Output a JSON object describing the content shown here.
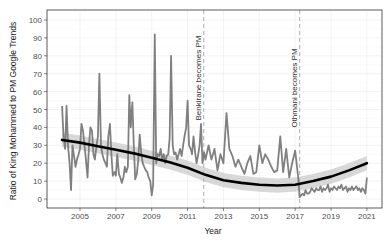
{
  "chart_data": {
    "type": "line",
    "title": "",
    "xlabel": "Year",
    "ylabel": "Ratio of King Mohammed to PM Google Trends",
    "xlim": [
      2003.2,
      2021.8
    ],
    "ylim": [
      -5,
      105
    ],
    "x_ticks": [
      2005,
      2007,
      2009,
      2011,
      2013,
      2015,
      2017,
      2019,
      2021
    ],
    "y_ticks": [
      0,
      10,
      20,
      30,
      40,
      50,
      60,
      70,
      80,
      90,
      100
    ],
    "grid": true,
    "legend": null,
    "colors": {
      "series": "#808080",
      "trend": "#000000",
      "ribbon": "#c8c8c8",
      "vline": "#bbbbbb",
      "panel_border": "#333333",
      "grid": "#ebebeb"
    },
    "annotations": [
      {
        "x": 2011.9,
        "label": "Benkirane becomes PM",
        "style": "dashed vertical line"
      },
      {
        "x": 2017.25,
        "label": "Othmani becomes PM",
        "style": "dashed vertical line"
      }
    ],
    "series": [
      {
        "name": "Monthly ratio",
        "style": "line",
        "x": [
          2004.0,
          2004.08,
          2004.17,
          2004.25,
          2004.33,
          2004.42,
          2004.5,
          2004.58,
          2004.67,
          2004.75,
          2004.83,
          2004.92,
          2005.0,
          2005.08,
          2005.17,
          2005.25,
          2005.33,
          2005.42,
          2005.5,
          2005.58,
          2005.67,
          2005.75,
          2005.83,
          2005.92,
          2006.0,
          2006.08,
          2006.17,
          2006.25,
          2006.33,
          2006.42,
          2006.5,
          2006.58,
          2006.67,
          2006.75,
          2006.83,
          2006.92,
          2007.0,
          2007.08,
          2007.17,
          2007.25,
          2007.33,
          2007.42,
          2007.5,
          2007.58,
          2007.67,
          2007.75,
          2007.83,
          2007.92,
          2008.0,
          2008.08,
          2008.17,
          2008.25,
          2008.33,
          2008.42,
          2008.5,
          2008.58,
          2008.67,
          2008.75,
          2008.83,
          2008.92,
          2009.0,
          2009.08,
          2009.17,
          2009.25,
          2009.33,
          2009.42,
          2009.5,
          2009.58,
          2009.67,
          2009.75,
          2009.83,
          2009.92,
          2010.0,
          2010.08,
          2010.17,
          2010.25,
          2010.33,
          2010.42,
          2010.5,
          2010.58,
          2010.67,
          2010.75,
          2010.83,
          2010.92,
          2011.0,
          2011.08,
          2011.17,
          2011.25,
          2011.33,
          2011.42,
          2011.5,
          2011.58,
          2011.67,
          2011.75,
          2011.83,
          2011.92,
          2012.0,
          2012.17,
          2012.33,
          2012.5,
          2012.67,
          2012.83,
          2013.0,
          2013.17,
          2013.33,
          2013.5,
          2013.67,
          2013.83,
          2014.0,
          2014.17,
          2014.33,
          2014.5,
          2014.67,
          2014.83,
          2015.0,
          2015.17,
          2015.33,
          2015.5,
          2015.67,
          2015.83,
          2016.0,
          2016.17,
          2016.33,
          2016.5,
          2016.67,
          2016.83,
          2017.0,
          2017.17,
          2017.25,
          2017.33,
          2017.42,
          2017.5,
          2017.58,
          2017.67,
          2017.75,
          2017.83,
          2017.92,
          2018.0,
          2018.08,
          2018.17,
          2018.25,
          2018.33,
          2018.42,
          2018.5,
          2018.58,
          2018.67,
          2018.75,
          2018.83,
          2018.92,
          2019.0,
          2019.08,
          2019.17,
          2019.25,
          2019.33,
          2019.42,
          2019.5,
          2019.58,
          2019.67,
          2019.75,
          2019.83,
          2019.92,
          2020.0,
          2020.08,
          2020.17,
          2020.25,
          2020.33,
          2020.42,
          2020.5,
          2020.58,
          2020.67,
          2020.75,
          2020.83,
          2020.92,
          2021.0
        ],
        "y": [
          52,
          35,
          28,
          52,
          30,
          20,
          5,
          30,
          24,
          18,
          22,
          25,
          28,
          42,
          38,
          30,
          22,
          12,
          30,
          40,
          38,
          25,
          22,
          30,
          35,
          70,
          30,
          25,
          22,
          20,
          18,
          35,
          42,
          25,
          13,
          15,
          13,
          25,
          14,
          12,
          9,
          12,
          18,
          15,
          18,
          58,
          40,
          54,
          30,
          11,
          14,
          22,
          36,
          25,
          20,
          18,
          16,
          15,
          12,
          10,
          2,
          8,
          92,
          20,
          25,
          24,
          28,
          22,
          25,
          20,
          24,
          25,
          34,
          80,
          30,
          25,
          26,
          22,
          25,
          28,
          24,
          30,
          35,
          40,
          55,
          30,
          28,
          25,
          35,
          26,
          20,
          24,
          30,
          42,
          20,
          26,
          22,
          30,
          22,
          28,
          16,
          25,
          20,
          48,
          28,
          24,
          18,
          22,
          18,
          14,
          20,
          24,
          14,
          15,
          30,
          20,
          25,
          22,
          18,
          15,
          16,
          35,
          15,
          28,
          12,
          20,
          27,
          12,
          1,
          2,
          3,
          2,
          5,
          3,
          3,
          4,
          6,
          5,
          4,
          6,
          5,
          5,
          7,
          4,
          6,
          5,
          6,
          8,
          4,
          6,
          5,
          7,
          6,
          5,
          7,
          6,
          8,
          5,
          6,
          7,
          4,
          6,
          5,
          7,
          5,
          6,
          7,
          5,
          6,
          4,
          6,
          5,
          3,
          12
        ],
        "note": "Values approximated from pixel positions; series x-range 2004-2021"
      },
      {
        "name": "Smoothed trend (LOESS)",
        "style": "thick black line with grey confidence ribbon",
        "x": [
          2004,
          2005,
          2006,
          2007,
          2008,
          2009,
          2010,
          2011,
          2012,
          2013,
          2014,
          2015,
          2016,
          2017,
          2018,
          2019,
          2020,
          2021
        ],
        "y": [
          33,
          31.5,
          29.5,
          27.5,
          25.5,
          23,
          20.5,
          17.5,
          13.5,
          10.5,
          9,
          8,
          7.5,
          8,
          10,
          12.5,
          16,
          20
        ]
      }
    ]
  }
}
